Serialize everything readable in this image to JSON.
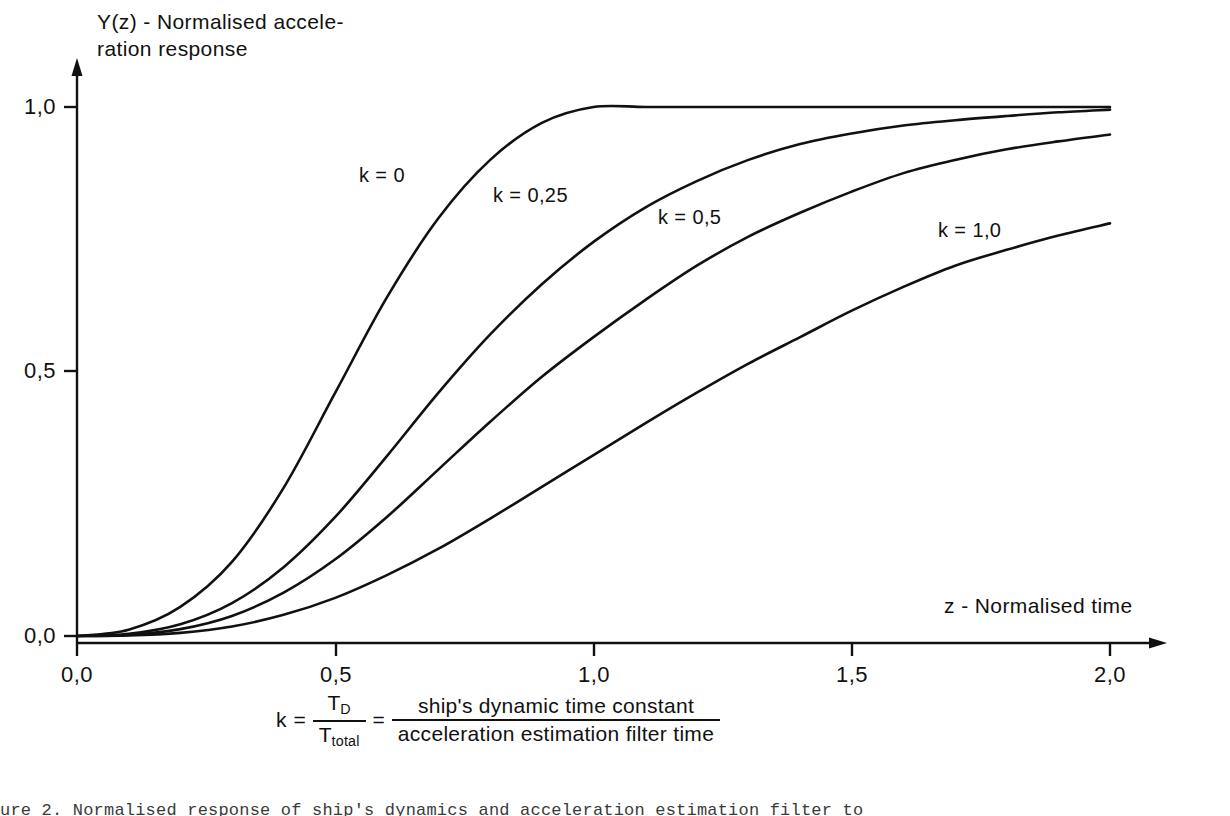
{
  "chart_data": {
    "type": "line",
    "title": "",
    "xlabel": "z - Normalised time",
    "ylabel": "Y(z) - Normalised acceleration response",
    "ylabel_line1": "Y(z) - Normalised accele-",
    "ylabel_line2": "ration response",
    "xlim": [
      0.0,
      2.0
    ],
    "ylim": [
      0.0,
      1.06
    ],
    "grid": false,
    "legend": "inline-curve-labels",
    "x_ticks": [
      0.0,
      0.5,
      1.0,
      1.5,
      2.0
    ],
    "x_tick_labels": [
      "0,0",
      "0,5",
      "1,0",
      "1,5",
      "2,0"
    ],
    "y_ticks": [
      0.0,
      0.5,
      1.0
    ],
    "y_tick_labels": [
      "0,0",
      "0,5",
      "1,0"
    ],
    "x": [
      0.0,
      0.1,
      0.2,
      0.3,
      0.4,
      0.5,
      0.6,
      0.7,
      0.8,
      0.9,
      1.0,
      1.1,
      1.2,
      1.3,
      1.4,
      1.5,
      1.6,
      1.7,
      1.8,
      1.9,
      2.0
    ],
    "series": [
      {
        "name": "k = 0",
        "k": 0,
        "label": "k = 0",
        "values": [
          0.0,
          0.012,
          0.055,
          0.14,
          0.28,
          0.46,
          0.64,
          0.79,
          0.9,
          0.97,
          1.0,
          1.0,
          1.0,
          1.0,
          1.0,
          1.0,
          1.0,
          1.0,
          1.0,
          1.0,
          1.0
        ]
      },
      {
        "name": "k = 0,25",
        "k": 0.25,
        "label": "k = 0,25",
        "values": [
          0.0,
          0.004,
          0.022,
          0.062,
          0.13,
          0.225,
          0.34,
          0.46,
          0.57,
          0.665,
          0.745,
          0.81,
          0.86,
          0.9,
          0.93,
          0.95,
          0.965,
          0.975,
          0.983,
          0.99,
          0.995
        ]
      },
      {
        "name": "k = 0,5",
        "k": 0.5,
        "label": "k = 0,5",
        "values": [
          0.0,
          0.002,
          0.013,
          0.038,
          0.082,
          0.145,
          0.225,
          0.315,
          0.405,
          0.49,
          0.565,
          0.635,
          0.7,
          0.755,
          0.8,
          0.84,
          0.875,
          0.9,
          0.92,
          0.935,
          0.948
        ]
      },
      {
        "name": "k = 1,0",
        "k": 1.0,
        "label": "k = 1,0",
        "values": [
          0.0,
          0.001,
          0.006,
          0.018,
          0.04,
          0.072,
          0.115,
          0.165,
          0.222,
          0.282,
          0.342,
          0.402,
          0.46,
          0.515,
          0.565,
          0.615,
          0.66,
          0.7,
          0.73,
          0.757,
          0.78
        ]
      }
    ],
    "curve_label_positions": [
      {
        "label": "k = 0",
        "x": 0.405,
        "y": 0.845
      },
      {
        "label": "k = 0,25",
        "x": 0.66,
        "y": 0.77
      },
      {
        "label": "k = 0,5",
        "x": 0.96,
        "y": 0.69
      },
      {
        "label": "k = 1,0",
        "x": 1.56,
        "y": 0.645
      }
    ],
    "annotations": [
      "k = T_D / T_total = ship's dynamic time constant / acceleration estimation filter time"
    ]
  },
  "formula": {
    "lead": "k",
    "equals_1": "=",
    "equals_2": "=",
    "numerator_1": "T",
    "numerator_1_sub": "D",
    "denominator_1": "T",
    "denominator_1_sub": "total",
    "numerator_2": "ship's dynamic time constant",
    "denominator_2": "acceleration estimation filter time"
  },
  "caption": {
    "text": "ure 2. Normalised response of ship's dynamics and acceleration estimation filter to"
  },
  "style": {
    "curve_color": "#111111",
    "axis_color": "#111111",
    "background": "#ffffff"
  }
}
